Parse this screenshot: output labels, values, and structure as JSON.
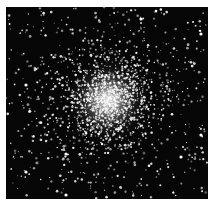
{
  "image": {
    "subject": "globular star cluster",
    "background_color": "#060606",
    "border_color": "#ffffff",
    "star_color": "#ffffff",
    "cluster_center": [
      102,
      93
    ],
    "field_size": [
      202,
      192
    ]
  }
}
